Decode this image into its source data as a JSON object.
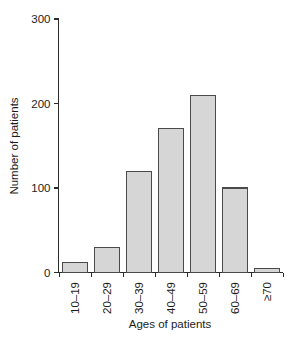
{
  "chart_data": {
    "type": "bar",
    "title": "",
    "subtitle": "",
    "xlabel": "Ages of patients",
    "ylabel": "Number of patients",
    "categories": [
      "10–19",
      "20–29",
      "30–39",
      "40–49",
      "50–59",
      "60–69",
      "≥70"
    ],
    "values": [
      12,
      30,
      120,
      170,
      210,
      100,
      5
    ],
    "series": [
      {
        "name": "Number of patients",
        "values": [
          12,
          30,
          120,
          170,
          210,
          100,
          5
        ]
      }
    ],
    "ylim": [
      0,
      300
    ],
    "yticks": [
      0,
      100,
      200,
      300
    ],
    "ytick_labels": [
      "0",
      "100",
      "200",
      "300"
    ],
    "grid": false,
    "legend": "none",
    "xtick_label_rotation": 90,
    "bar_fill_color": "#d6d6d6",
    "bar_edge_color": "#4a4a4a",
    "axis_color": "#2b2b2b",
    "background_color": "#ffffff"
  }
}
